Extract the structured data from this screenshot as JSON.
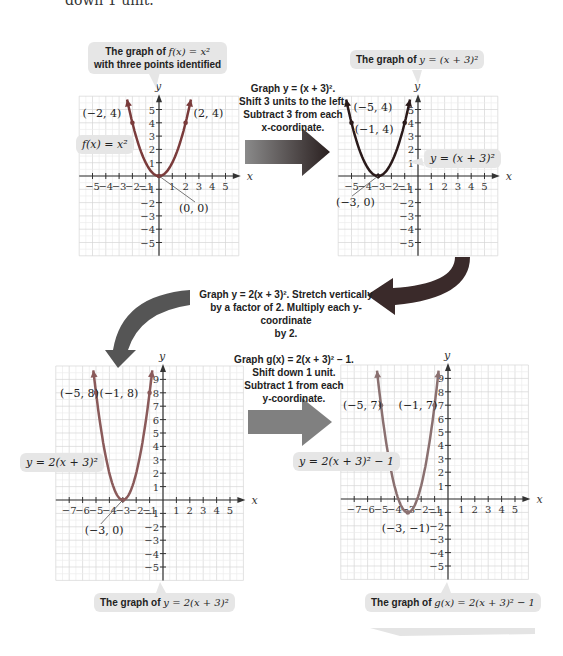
{
  "top_fragment": "down 1 unit.",
  "bubbles": {
    "g1_title": "The graph of f(x) = x² with three points identified",
    "g1_title_line1": "The graph of ",
    "g1_title_math": "f(x) = x²",
    "g1_title_line2": "with three points identified",
    "g1_label": "f(x) = x²",
    "g2_title_pre": "The graph of ",
    "g2_title_math": "y = (x + 3)²",
    "g2_label": "y = (x + 3)²",
    "g3_label": "y = 2(x + 3)²",
    "g3_title_pre": "The graph of ",
    "g3_title_math": "y = 2(x + 3)²",
    "g4_label": "y = 2(x + 3)² − 1",
    "g4_title_pre": "The graph of ",
    "g4_title_math": "g(x) = 2(x + 3)² − 1"
  },
  "steps": {
    "step1": [
      "Graph y = (x + 3)².",
      "Shift 3 units to the left.",
      "Subtract 3 from each",
      "x-coordinate."
    ],
    "step2": [
      "Graph y = 2(x + 3)². Stretch vertically",
      "by a factor of 2. Multiply each y-coordinate",
      "by 2."
    ],
    "step3": [
      "Graph g(x) = 2(x + 3)² − 1.",
      "Shift down 1 unit.",
      "Subtract 1 from each",
      "y-coordinate."
    ]
  },
  "colors": {
    "curve1": "#7a3b3b",
    "curve2": "#2a1a1a",
    "curve3": "#8a5a5a",
    "curve4": "#8a7070",
    "arrow_dark": "#3a2a2a",
    "bubble": "#e6e6e6",
    "grid": "#dcdcdc"
  },
  "chart_data": [
    {
      "type": "line",
      "title": "The graph of f(x) = x² with three points identified",
      "function": "f(x) = x^2",
      "xlabel": "x",
      "ylabel": "y",
      "xlim": [
        -5,
        5
      ],
      "ylim": [
        -5,
        5
      ],
      "grid": true,
      "x": [
        -2.4,
        -2,
        -1,
        0,
        1,
        2,
        2.4
      ],
      "y": [
        5.76,
        4,
        1,
        0,
        1,
        4,
        5.76
      ],
      "points": [
        {
          "label": "(-2, 4)",
          "x": -2,
          "y": 4
        },
        {
          "label": "(0, 0)",
          "x": 0,
          "y": 0
        },
        {
          "label": "(2, 4)",
          "x": 2,
          "y": 4
        }
      ]
    },
    {
      "type": "line",
      "title": "The graph of y = (x + 3)²",
      "function": "y = (x+3)^2",
      "xlabel": "x",
      "ylabel": "y",
      "xlim": [
        -5,
        5
      ],
      "ylim": [
        -5,
        5
      ],
      "grid": true,
      "x": [
        -5.4,
        -5,
        -4,
        -3,
        -2,
        -1,
        -0.6
      ],
      "y": [
        5.76,
        4,
        1,
        0,
        1,
        4,
        5.76
      ],
      "points": [
        {
          "label": "(-5, 4)",
          "x": -5,
          "y": 4
        },
        {
          "label": "(-3, 0)",
          "x": -3,
          "y": 0
        },
        {
          "label": "(-1, 4)",
          "x": -1,
          "y": 4
        }
      ]
    },
    {
      "type": "line",
      "title": "The graph of y = 2(x + 3)²",
      "function": "y = 2(x+3)^2",
      "xlabel": "x",
      "ylabel": "y",
      "xlim": [
        -7,
        5
      ],
      "ylim": [
        -5,
        9
      ],
      "grid": true,
      "x": [
        -5.2,
        -5,
        -4,
        -3,
        -2,
        -1,
        -0.8
      ],
      "y": [
        9.68,
        8,
        2,
        0,
        2,
        8,
        9.68
      ],
      "points": [
        {
          "label": "(-5, 8)",
          "x": -5,
          "y": 8
        },
        {
          "label": "(-3, 0)",
          "x": -3,
          "y": 0
        },
        {
          "label": "(-1, 8)",
          "x": -1,
          "y": 8
        }
      ]
    },
    {
      "type": "line",
      "title": "The graph of g(x) = 2(x + 3)² − 1",
      "function": "g(x) = 2(x+3)^2 - 1",
      "xlabel": "x",
      "ylabel": "y",
      "xlim": [
        -7,
        5
      ],
      "ylim": [
        -5,
        9
      ],
      "grid": true,
      "x": [
        -5.3,
        -5,
        -4,
        -3,
        -2,
        -1,
        -0.7
      ],
      "y": [
        9.58,
        7,
        1,
        -1,
        1,
        7,
        9.58
      ],
      "points": [
        {
          "label": "(-5, 7)",
          "x": -5,
          "y": 7
        },
        {
          "label": "(-3, -1)",
          "x": -3,
          "y": -1
        },
        {
          "label": "(-1, 7)",
          "x": -1,
          "y": 7
        }
      ]
    }
  ]
}
